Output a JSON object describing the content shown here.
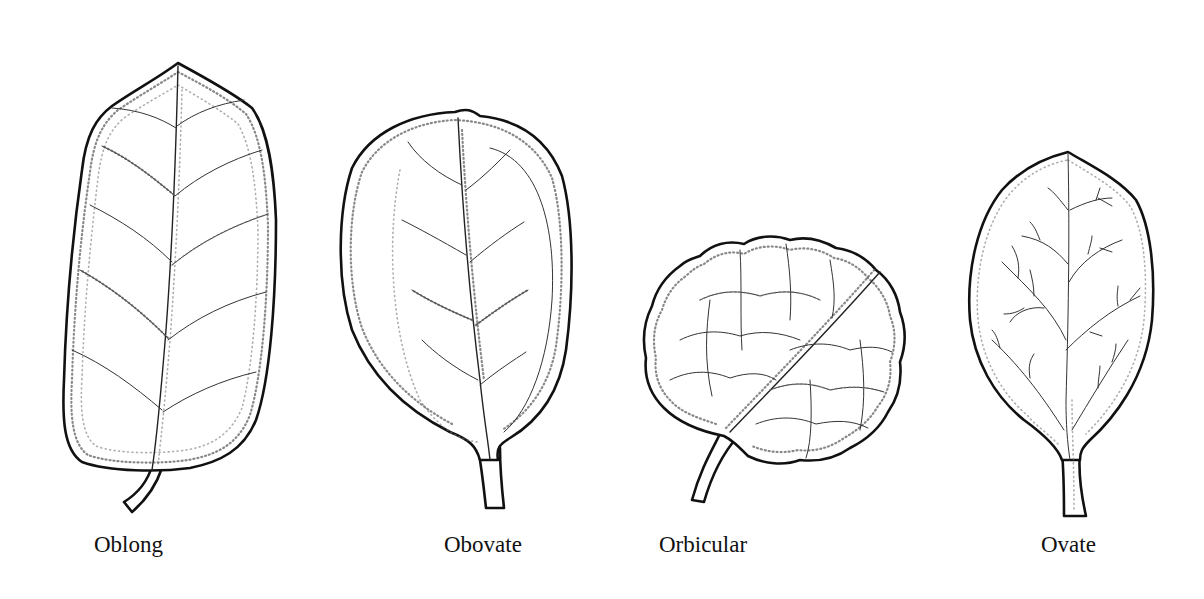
{
  "figure": {
    "leaves": [
      {
        "id": "oblong",
        "label": "Oblong"
      },
      {
        "id": "obovate",
        "label": "Obovate"
      },
      {
        "id": "orbicular",
        "label": "Orbicular"
      },
      {
        "id": "ovate",
        "label": "Ovate"
      }
    ]
  },
  "colors": {
    "ink": "#111111",
    "paper": "#ffffff"
  }
}
